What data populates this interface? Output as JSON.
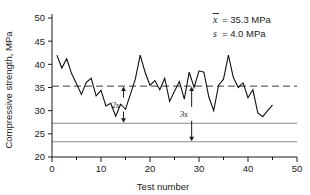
{
  "chart_data": {
    "type": "line",
    "title": "",
    "xlabel": "Test number",
    "ylabel": "Compressive strength, MPa",
    "xlim": [
      0,
      50
    ],
    "ylim": [
      20,
      50
    ],
    "xticks": [
      0,
      10,
      20,
      30,
      40,
      50
    ],
    "yticks": [
      20,
      25,
      30,
      35,
      40,
      45,
      50
    ],
    "xminorticks": [
      5,
      15,
      25,
      35,
      45
    ],
    "grid": false,
    "legend": "none",
    "x": [
      1,
      2,
      3,
      4,
      5,
      6,
      7,
      8,
      9,
      10,
      11,
      12,
      13,
      14,
      15,
      16,
      17,
      18,
      19,
      20,
      21,
      22,
      23,
      24,
      25,
      26,
      27,
      28,
      29,
      30,
      31,
      32,
      33,
      34,
      35,
      36,
      37,
      38,
      39,
      40,
      41,
      42,
      43,
      44,
      45
    ],
    "series": [
      {
        "name": "Compressive strength",
        "values": [
          42.0,
          39.2,
          41.2,
          38.0,
          35.8,
          33.5,
          36.1,
          37.0,
          33.2,
          34.4,
          31.0,
          31.6,
          28.8,
          31.4,
          30.3,
          33.5,
          36.8,
          42.0,
          38.3,
          35.5,
          36.5,
          34.5,
          37.0,
          32.0,
          34.2,
          36.3,
          32.5,
          38.3,
          35.0,
          38.6,
          38.3,
          33.0,
          30.0,
          35.5,
          36.8,
          42.0,
          37.2,
          35.0,
          36.0,
          32.8,
          34.5,
          29.5,
          28.7,
          30.0,
          31.2
        ],
        "color": "#111111"
      }
    ],
    "reference_lines": [
      {
        "name": "mean",
        "value": 35.3,
        "style": "dashed",
        "color": "#3a3a3a"
      },
      {
        "name": "mean-minus-2s",
        "value": 27.3,
        "style": "solid",
        "color": "#8a8a8a"
      },
      {
        "name": "mean-minus-3s",
        "value": 23.3,
        "style": "solid",
        "color": "#8a8a8a"
      }
    ],
    "annotations": [
      {
        "name": "two-sigma",
        "label": "2s",
        "x": 14.6,
        "from": 35.3,
        "to": 27.3
      },
      {
        "name": "three-sigma",
        "label": "3s",
        "x": 28.5,
        "from": 35.3,
        "to": 23.3
      }
    ],
    "stats": {
      "mean_symbol": "x",
      "mean_text": "= 35.3 MPa",
      "sd_symbol": "s",
      "sd_text": "= 4.0 MPa"
    }
  }
}
